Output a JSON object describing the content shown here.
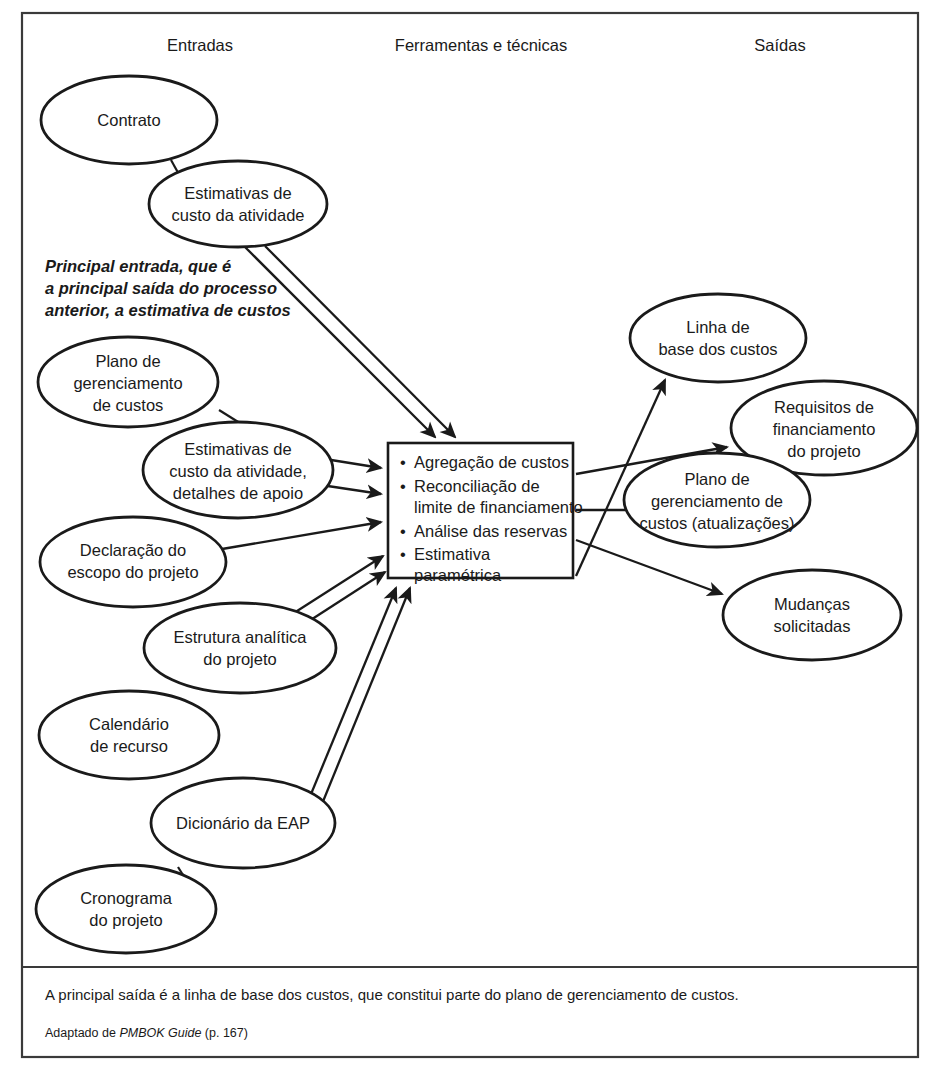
{
  "figure": {
    "title_columns": {
      "inputs": "Entradas",
      "tools": "Ferramentas e técnicas",
      "outputs": "Saídas"
    },
    "annotation_note": {
      "line1": "Principal entrada, que é",
      "line2": "a principal saída do processo",
      "line3": "anterior, a estimativa de custos"
    },
    "inputs": [
      {
        "id": "contrato",
        "lines": [
          "Contrato"
        ]
      },
      {
        "id": "estimativas-custo-atividade",
        "lines": [
          "Estimativas de",
          "custo da atividade"
        ]
      },
      {
        "id": "plano-gerenciamento-custos",
        "lines": [
          "Plano de",
          "gerenciamento",
          "de custos"
        ]
      },
      {
        "id": "estimativas-detalhes-apoio",
        "lines": [
          "Estimativas de",
          "custo da atividade,",
          "detalhes de apoio"
        ]
      },
      {
        "id": "declaracao-escopo",
        "lines": [
          "Declaração do",
          "escopo do projeto"
        ]
      },
      {
        "id": "estrutura-analitica",
        "lines": [
          "Estrutura analítica",
          "do projeto"
        ]
      },
      {
        "id": "calendario-recurso",
        "lines": [
          "Calendário",
          "de recurso"
        ]
      },
      {
        "id": "dicionario-eap",
        "lines": [
          "Dicionário da EAP"
        ]
      },
      {
        "id": "cronograma-projeto",
        "lines": [
          "Cronograma",
          "do projeto"
        ]
      }
    ],
    "process_box": {
      "id": "ferramentas-tecnicas-box",
      "bullets": [
        {
          "lines": [
            "Agregação de custos"
          ]
        },
        {
          "lines": [
            "Reconciliação de",
            "limite de financiamento"
          ]
        },
        {
          "lines": [
            "Análise das reservas"
          ]
        },
        {
          "lines": [
            "Estimativa",
            "paramétrica"
          ]
        }
      ]
    },
    "outputs": [
      {
        "id": "linha-base-custos",
        "lines": [
          "Linha de",
          "base dos custos"
        ]
      },
      {
        "id": "requisitos-financiamento",
        "lines": [
          "Requisitos de",
          "financiamento",
          "do projeto"
        ]
      },
      {
        "id": "plano-gerenciamento-atualizacoes",
        "lines": [
          "Plano de",
          "gerenciamento de",
          "custos (atualizações)"
        ]
      },
      {
        "id": "mudancas-solicitadas",
        "lines": [
          "Mudanças",
          "solicitadas"
        ]
      }
    ],
    "footer": {
      "caption": "A principal saída é a linha de base dos custos, que constitui parte do plano de gerenciamento de custos.",
      "source_prefix": "Adaptado de ",
      "source_title": "PMBOK Guide",
      "source_suffix": " (p. 167)"
    },
    "colors": {
      "ink": "#1a1a1a",
      "frame": "#3a3a3a",
      "paper": "#ffffff"
    }
  }
}
